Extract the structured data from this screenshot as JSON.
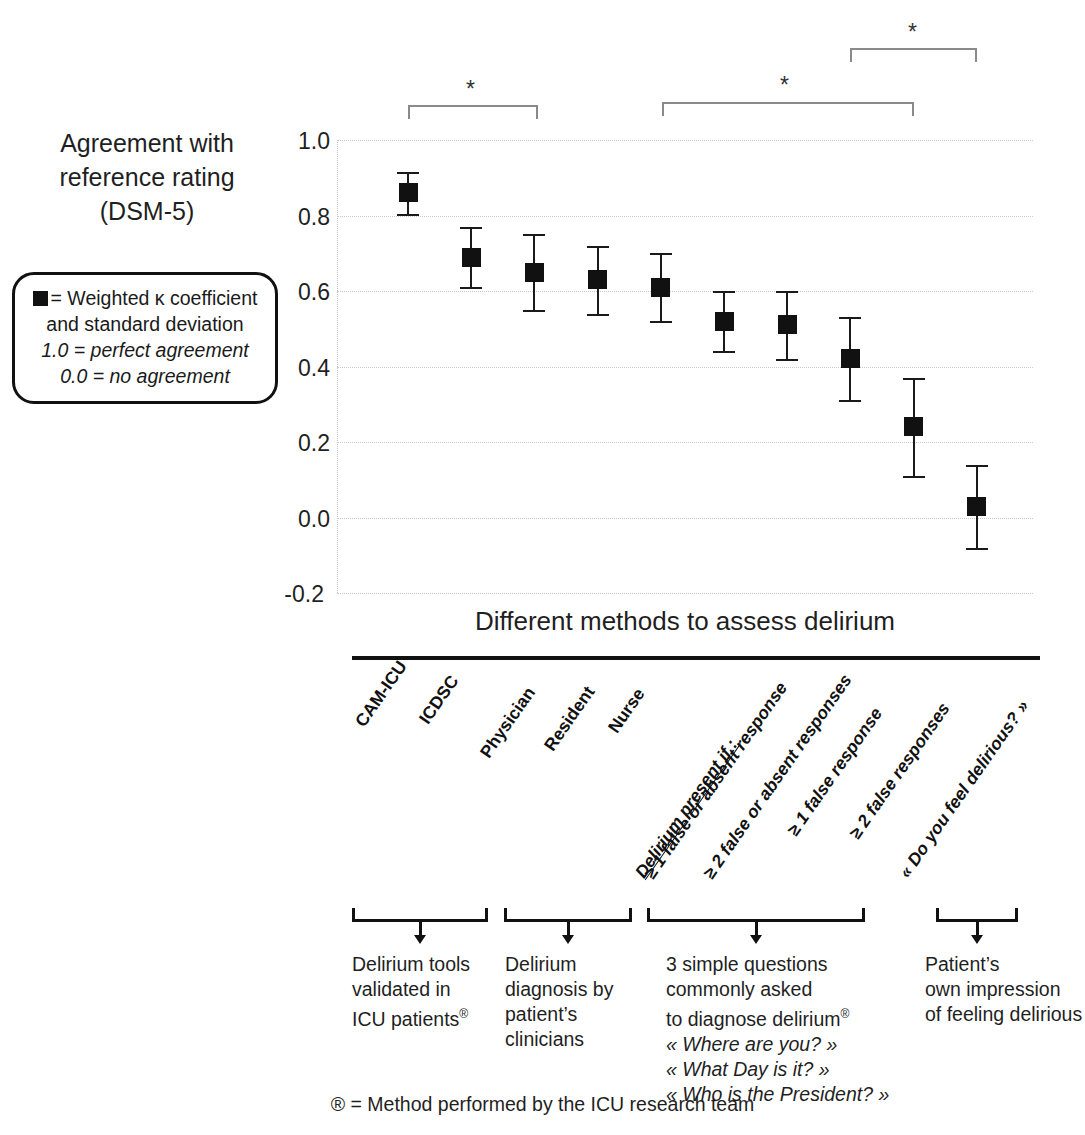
{
  "axis_title_y": "Agreement with reference rating (DSM-5)",
  "axis_title_y_lines": [
    "Agreement with",
    "reference rating",
    "(DSM-5)"
  ],
  "legend": {
    "line1": "= Weighted κ coefficient",
    "line2": "and standard deviation",
    "line3": "1.0 = perfect agreement",
    "line4": "0.0 = no agreement"
  },
  "x_axis_title": "Different methods to assess delirium",
  "footnote": "® = Method performed by the ICU research team",
  "groups": [
    {
      "id": "delirium-tools",
      "lines": [
        "Delirium tools",
        "validated in",
        "ICU patients®"
      ]
    },
    {
      "id": "clinician-diagnosis",
      "lines": [
        "Delirium",
        "diagnosis by",
        "patient’s",
        "clinicians"
      ]
    },
    {
      "id": "three-simple-questions",
      "lines": [
        "3 simple questions",
        "commonly asked",
        "to diagnose delirium®"
      ],
      "questions": [
        "« Where are you? »",
        "« What Day is it? »",
        "« Who is the President? »"
      ]
    },
    {
      "id": "patient-impression",
      "lines": [
        "Patient’s",
        "own impression",
        "of feeling delirious"
      ]
    }
  ],
  "significance": [
    {
      "label": "*",
      "from": "CAM-ICU",
      "to": "Physician"
    },
    {
      "label": "*",
      "from": "Nurse",
      "to": "≥ 2 false responses"
    },
    {
      "label": "*",
      "from": "≥ 1 false response",
      "to": "« Do you feel delirious? »"
    }
  ],
  "chart_data": {
    "type": "scatter",
    "title": "",
    "xlabel": "Different methods to assess delirium",
    "ylabel": "Agreement with reference rating (DSM-5)",
    "ylim": [
      -0.2,
      1.0
    ],
    "yticks": [
      1.0,
      0.8,
      0.6,
      0.4,
      0.2,
      0.0,
      -0.2
    ],
    "ytick_labels": [
      "1.0",
      "0.8",
      "0.6",
      "0.4",
      "0.2",
      "0.0",
      "-0.2"
    ],
    "grid": true,
    "legend_position": "left-outside",
    "categories": [
      "CAM-ICU",
      "ICDSC",
      "Physician",
      "Resident",
      "Nurse",
      "≥ 1 false or absent response",
      "≥ 2 false or absent responses",
      "≥ 1 false response",
      "≥ 2 false responses",
      "« Do you feel delirious? »"
    ],
    "category_prefix_label": "Delirium present if :",
    "series": [
      {
        "name": "Weighted κ coefficient",
        "values": [
          0.86,
          0.69,
          0.65,
          0.63,
          0.61,
          0.52,
          0.51,
          0.42,
          0.24,
          0.03
        ],
        "errors": [
          0.055,
          0.08,
          0.1,
          0.09,
          0.09,
          0.08,
          0.09,
          0.11,
          0.13,
          0.11
        ],
        "error_type": "standard deviation"
      }
    ]
  }
}
